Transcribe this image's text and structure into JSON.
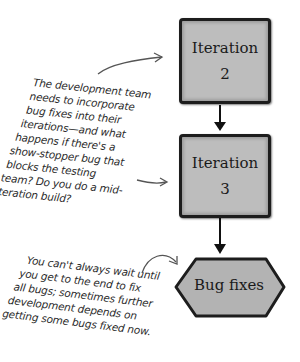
{
  "diagram": {
    "nodes": [
      {
        "id": "iteration-2",
        "shape": "rounded-square",
        "line1": "Iteration",
        "line2": "2"
      },
      {
        "id": "iteration-3",
        "shape": "rounded-square",
        "line1": "Iteration",
        "line2": "3"
      },
      {
        "id": "bug-fixes",
        "shape": "hexagon",
        "label": "Bug fixes"
      }
    ],
    "edges": [
      {
        "from": "iteration-2",
        "to": "iteration-3"
      },
      {
        "from": "iteration-3",
        "to": "bug-fixes"
      }
    ],
    "annotations": {
      "top": {
        "lines": [
          "The development team",
          "needs to incorporate",
          "bug fixes into their",
          "iterations—and what",
          "happens if there's a",
          "show-stopper bug that",
          "blocks the testing",
          "team? Do you do a mid-",
          "iteration build?"
        ]
      },
      "bottom": {
        "lines": [
          "You can't always wait until",
          "you get to the end to fix",
          "all bugs; sometimes further",
          "development depends on",
          "getting some bugs fixed now."
        ]
      }
    },
    "colors": {
      "box_fill": "#bdbdbd",
      "border": "#1d1d1d",
      "text": "#2a2a2a"
    }
  }
}
